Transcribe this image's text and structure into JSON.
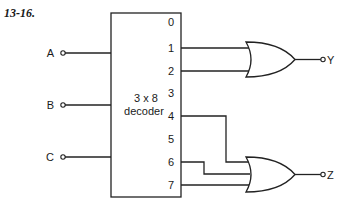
{
  "figure": {
    "label": "13-16."
  },
  "inputs": [
    {
      "name": "A"
    },
    {
      "name": "B"
    },
    {
      "name": "C"
    }
  ],
  "decoder": {
    "line1": "3 x 8",
    "line2": "decoder",
    "outputs": [
      "0",
      "1",
      "2",
      "3",
      "4",
      "5",
      "6",
      "7"
    ]
  },
  "gates": [
    {
      "type": "OR",
      "inputs_from": [
        "1",
        "2"
      ],
      "output": "Y"
    },
    {
      "type": "OR",
      "inputs_from": [
        "4",
        "6",
        "7"
      ],
      "output": "Z"
    }
  ],
  "colors": {
    "line": "#222222",
    "background": "#ffffff"
  }
}
